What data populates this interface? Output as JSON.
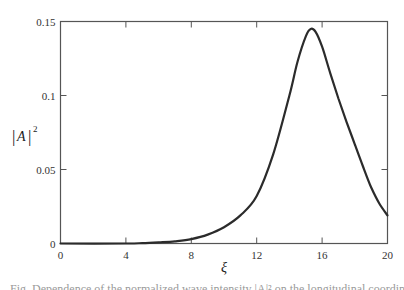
{
  "chart_data": {
    "type": "line",
    "title": "",
    "xlabel": "ξ",
    "ylabel": "|A|²",
    "xlim": [
      0,
      20
    ],
    "ylim": [
      0,
      0.15
    ],
    "x_ticks": [
      0,
      4,
      8,
      12,
      16,
      20
    ],
    "x_tick_labels": [
      "0",
      "4",
      "8",
      "12",
      "16",
      "20"
    ],
    "y_ticks": [
      0,
      0.05,
      0.1,
      0.15
    ],
    "y_tick_labels": [
      "0",
      "0.05",
      "0.1",
      "0.15"
    ],
    "grid": false,
    "legend": null,
    "series": [
      {
        "name": "|A|^2",
        "x": [
          0,
          4,
          5,
          6,
          7,
          8,
          9,
          10,
          11,
          12,
          13,
          14,
          14.5,
          15,
          15.3,
          15.6,
          16,
          16.5,
          17,
          17.5,
          18,
          18.5,
          19,
          19.5,
          20
        ],
        "values": [
          0,
          0,
          0.0003,
          0.0008,
          0.0015,
          0.003,
          0.006,
          0.011,
          0.019,
          0.032,
          0.06,
          0.1,
          0.123,
          0.14,
          0.145,
          0.143,
          0.133,
          0.115,
          0.098,
          0.082,
          0.067,
          0.052,
          0.038,
          0.027,
          0.019
        ]
      }
    ],
    "line_color": "#2b2b2b"
  },
  "labels": {
    "x_axis": "ξ",
    "y_axis_base": "|A|",
    "y_axis_sup": "2"
  },
  "caption": {
    "text": "Fig. Dependence of the normalized wave intensity |A|² on the longitudinal coordinate ξ"
  }
}
